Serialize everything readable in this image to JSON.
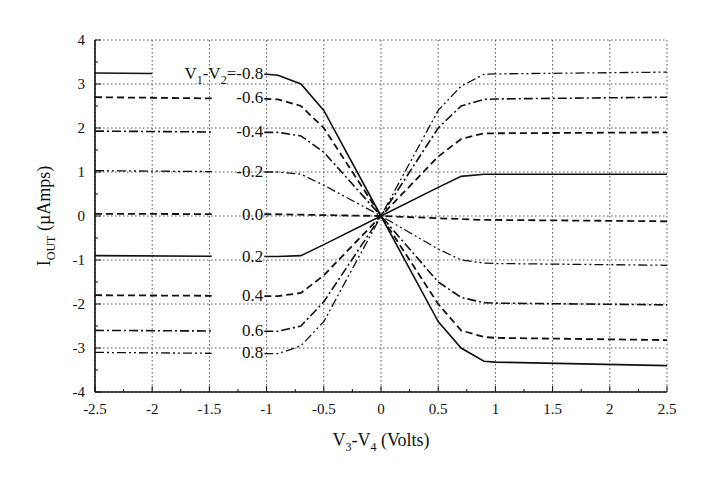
{
  "chart_data": {
    "type": "line",
    "title": "",
    "xlabel": "V3-V4 (Volts)",
    "ylabel": "IOUT (µAmps)",
    "xlabel_parts": {
      "v1": "V",
      "s1": "3",
      "mid": "-V",
      "s2": "4",
      "rest": " (Volts)"
    },
    "ylabel_parts": {
      "main": "I",
      "sub": "OUT",
      "rest": " (µAmps)"
    },
    "xlim": [
      -2.5,
      2.5
    ],
    "ylim": [
      -4,
      4
    ],
    "grid": true,
    "legend_position": "inline labels at x≈-1.0",
    "x_ticks": [
      "-2.5",
      "-2",
      "-1.5",
      "-1",
      "-0.5",
      "0",
      "0.5",
      "1",
      "1.5",
      "2",
      "2.5"
    ],
    "y_ticks": [
      "4",
      "3",
      "2",
      "1",
      "0",
      "-1",
      "-2",
      "-3",
      "-4"
    ],
    "parameter_label": "V1-V2=",
    "x": [
      -2.5,
      -1.0,
      -0.9,
      -0.7,
      -0.5,
      0.0,
      0.5,
      0.7,
      0.9,
      1.0,
      2.5
    ],
    "series": [
      {
        "name": "-0.8",
        "label": "V1-V2=-0.8",
        "style": "solid",
        "values": [
          3.25,
          3.22,
          3.2,
          3.0,
          2.4,
          0.0,
          -2.4,
          -3.0,
          -3.3,
          -3.32,
          -3.4
        ]
      },
      {
        "name": "-0.6",
        "label": "-0.6",
        "style": "dashed",
        "values": [
          2.7,
          2.66,
          2.65,
          2.5,
          2.0,
          0.0,
          -2.0,
          -2.6,
          -2.75,
          -2.77,
          -2.82
        ]
      },
      {
        "name": "-0.4",
        "label": "-0.4",
        "style": "dashdot",
        "values": [
          1.93,
          1.9,
          1.9,
          1.82,
          1.45,
          0.0,
          -1.5,
          -1.85,
          -1.97,
          -1.98,
          -2.02
        ]
      },
      {
        "name": "-0.2",
        "label": "-0.2",
        "style": "dashdotdot",
        "values": [
          1.03,
          1.0,
          1.0,
          0.95,
          0.7,
          0.0,
          -0.75,
          -1.0,
          -1.07,
          -1.08,
          -1.12
        ]
      },
      {
        "name": "0.0",
        "label": "0.0",
        "style": "dashed",
        "values": [
          0.05,
          0.04,
          0.04,
          0.03,
          0.02,
          0.0,
          -0.05,
          -0.07,
          -0.09,
          -0.09,
          -0.12
        ]
      },
      {
        "name": "0.2",
        "label": "0.2",
        "style": "solid",
        "values": [
          -0.9,
          -0.92,
          -0.92,
          -0.9,
          -0.65,
          0.0,
          0.65,
          0.9,
          0.95,
          0.95,
          0.95
        ]
      },
      {
        "name": "0.4",
        "label": "0.4",
        "style": "dashed",
        "values": [
          -1.8,
          -1.82,
          -1.82,
          -1.75,
          -1.35,
          0.0,
          1.35,
          1.75,
          1.88,
          1.88,
          1.9
        ]
      },
      {
        "name": "0.6",
        "label": "0.6",
        "style": "dashdot",
        "values": [
          -2.6,
          -2.62,
          -2.62,
          -2.5,
          -1.95,
          0.0,
          2.0,
          2.5,
          2.65,
          2.66,
          2.7
        ]
      },
      {
        "name": "0.8",
        "label": "0.8",
        "style": "dashdotdot",
        "values": [
          -3.1,
          -3.13,
          -3.13,
          -2.95,
          -2.4,
          0.0,
          2.4,
          2.95,
          3.22,
          3.23,
          3.27
        ]
      }
    ]
  }
}
